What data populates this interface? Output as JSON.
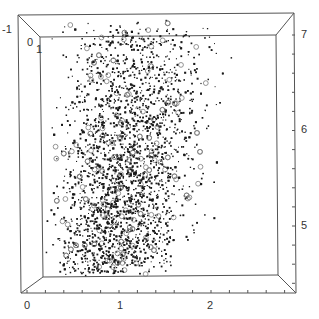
{
  "chart_data": {
    "type": "scatter",
    "title": "",
    "xlabel": "",
    "ylabel": "",
    "zlabel": "",
    "projection": "3d-box",
    "grid": false,
    "legend": null,
    "x_axis": {
      "ticks": [
        "0",
        "1",
        "2"
      ],
      "tick_values": [
        0,
        1,
        2
      ],
      "range": [
        0,
        2.9
      ],
      "minor_step": 0.2
    },
    "y_axis_right": {
      "ticks": [
        "5",
        "6",
        "7"
      ],
      "tick_values": [
        5,
        6,
        7
      ],
      "range": [
        4.5,
        7.1
      ],
      "minor_step": 0.2
    },
    "depth_axis": {
      "ticks": [
        "-1",
        "0",
        "1"
      ],
      "tick_values": [
        -1,
        0,
        1
      ]
    },
    "marker": {
      "dot_color": "#1a1a1a",
      "circle_color": "#7a7a7a",
      "dot_size": 1.4,
      "circle_radius": 2.4
    },
    "density_summary": {
      "x_center": 1.2,
      "x_spread": 0.35,
      "x_min": 0.3,
      "x_max": 2.05,
      "y_min": 4.55,
      "y_max": 7.1,
      "densest_region": {
        "x": [
          0.9,
          1.5
        ],
        "y": [
          6.2,
          7.0
        ]
      },
      "approx_point_count": 3000,
      "open_circle_fraction": 0.06
    },
    "sample_points": [
      [
        1.0,
        6.8
      ],
      [
        1.1,
        6.9
      ],
      [
        1.2,
        6.7
      ],
      [
        1.3,
        6.95
      ],
      [
        1.4,
        6.85
      ],
      [
        0.9,
        6.6
      ],
      [
        1.5,
        6.5
      ],
      [
        1.25,
        6.3
      ],
      [
        1.05,
        6.1
      ],
      [
        0.8,
        6.0
      ],
      [
        1.6,
        6.2
      ],
      [
        1.7,
        6.0
      ],
      [
        0.7,
        5.8
      ],
      [
        1.3,
        5.7
      ],
      [
        1.45,
        5.5
      ],
      [
        1.0,
        5.4
      ],
      [
        0.6,
        5.2
      ],
      [
        1.2,
        5.0
      ],
      [
        0.9,
        4.8
      ],
      [
        1.4,
        4.7
      ],
      [
        0.5,
        4.65
      ],
      [
        1.8,
        5.6
      ],
      [
        1.9,
        5.9
      ],
      [
        2.0,
        6.4
      ],
      [
        0.4,
        5.5
      ],
      [
        0.35,
        6.1
      ],
      [
        1.55,
        6.9
      ],
      [
        1.75,
        6.7
      ],
      [
        0.95,
        7.05
      ],
      [
        1.15,
        7.1
      ]
    ]
  },
  "axes_labels": {
    "bottom": [
      "0",
      "1",
      "2"
    ],
    "right": [
      "7",
      "6",
      "5"
    ],
    "corner_left": [
      "-1",
      "0",
      "1"
    ]
  }
}
